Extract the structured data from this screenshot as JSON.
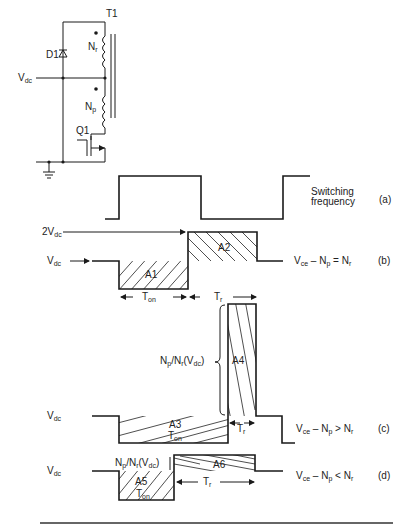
{
  "circuit": {
    "labels": {
      "transformer": "T1",
      "diode": "D1",
      "supply": "V",
      "supply_sub": "dc",
      "reset_winding": "N",
      "reset_winding_sub": "r",
      "primary_winding": "N",
      "primary_winding_sub": "p",
      "switch": "Q1"
    }
  },
  "waveforms": {
    "a": {
      "description": "Switching",
      "description2": "frequency",
      "tag": "(a)"
    },
    "b": {
      "level_2vdc": "2V",
      "level_2vdc_sub": "dc",
      "level_vdc": "V",
      "level_vdc_sub": "dc",
      "area1": "A1",
      "area2": "A2",
      "t_on": "T",
      "t_on_sub": "on",
      "t_r": "T",
      "t_r_sub": "r",
      "condition": "V",
      "condition_sub": "ce",
      "condition_rest": " – N",
      "condition_p": "p",
      "condition_op": " = N",
      "condition_r": "r",
      "tag": "(b)"
    },
    "c": {
      "level_vdc": "V",
      "level_vdc_sub": "dc",
      "brace_label": "N",
      "brace_p": "p",
      "brace_mid": "/N",
      "brace_r": "r",
      "brace_open": "(V",
      "brace_dc": "dc",
      "brace_close": ")",
      "area3": "A3",
      "area4": "A4",
      "t_on": "T",
      "t_on_sub": "on",
      "t_r": "T",
      "t_r_sub": "r",
      "condition": "V",
      "condition_sub": "ce",
      "condition_rest": " – N",
      "condition_p": "p",
      "condition_op": " > N",
      "condition_r": "r",
      "tag": "(c)"
    },
    "d": {
      "level_vdc": "V",
      "level_vdc_sub": "dc",
      "step_label": "N",
      "step_p": "p",
      "step_mid": "/N",
      "step_r": "r",
      "step_open": "(V",
      "step_dc": "dc",
      "step_close": ")",
      "area5": "A5",
      "area6": "A6",
      "t_on": "T",
      "t_on_sub": "on",
      "t_r": "T",
      "t_r_sub": "r",
      "condition": "V",
      "condition_sub": "ce",
      "condition_rest": " – N",
      "condition_p": "p",
      "condition_op": " < N",
      "condition_r": "r",
      "tag": "(d)"
    }
  }
}
